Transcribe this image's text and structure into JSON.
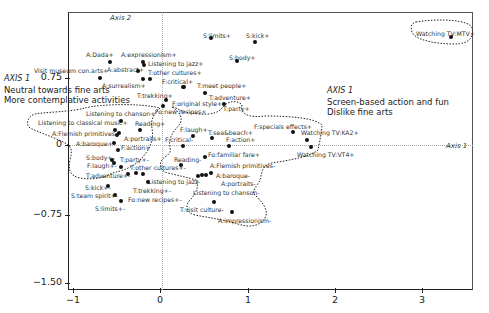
{
  "chart_data": {
    "type": "scatter",
    "title": "",
    "xlabel": "Axis 1",
    "ylabel": "Axis 2",
    "xlim": [
      -1.05,
      3.5
    ],
    "ylim": [
      -1.6,
      1.5
    ],
    "grid": false,
    "x_ticks": [
      "-1",
      "0",
      "1",
      "2",
      "3"
    ],
    "y_ticks": [
      "0.75",
      "0",
      "-0.75",
      "-1.50"
    ],
    "annotations": {
      "left": {
        "axis": "AXIS 1",
        "lines": [
          "Neutral towards fine arts",
          "More contemplative activities"
        ]
      },
      "right": {
        "axis": "AXIS 1",
        "lines": [
          "Screen-based action and fun",
          "Dislike fine arts"
        ]
      },
      "axis1_label": "Axis 1",
      "axis2_label": "Axis 2"
    },
    "points": [
      {
        "label": "Watching TV:MTV+",
        "x": 3.17,
        "y": 1.08
      },
      {
        "label": "S:limits+",
        "x": 0.55,
        "y": 1.18
      },
      {
        "label": "S:kick+",
        "x": 1.05,
        "y": 1.15
      },
      {
        "label": "S:body+",
        "x": 0.88,
        "y": 0.95
      },
      {
        "label": "A:Dada+",
        "x": -0.55,
        "y": 0.92
      },
      {
        "label": "A:expressionism+",
        "x": -0.1,
        "y": 0.92
      },
      {
        "label": "Listening to jazz+",
        "x": -0.08,
        "y": 0.88
      },
      {
        "label": "A:abstract+",
        "x": -0.17,
        "y": 0.82
      },
      {
        "label": "T:other cultures+",
        "x": -0.08,
        "y": 0.78
      },
      {
        "label": "Visit museum con.arts+",
        "x": -0.63,
        "y": 0.79
      },
      {
        "label": "A:surrealism+",
        "x": -0.08,
        "y": 0.74
      },
      {
        "label": "F:critical+",
        "x": 0.15,
        "y": 0.69
      },
      {
        "label": "T:meet people+",
        "x": 0.3,
        "y": 0.64
      },
      {
        "label": "T:adventure+",
        "x": 0.47,
        "y": 0.62
      },
      {
        "label": "T:trekking+",
        "x": 0.13,
        "y": 0.58
      },
      {
        "label": "F:original style+",
        "x": -0.02,
        "y": 0.53
      },
      {
        "label": "T:party+",
        "x": 0.5,
        "y": 0.55
      },
      {
        "label": "Fo:new recipes+",
        "x": -0.03,
        "y": 0.49
      },
      {
        "label": "Listening to chanson+",
        "x": -0.33,
        "y": 0.38
      },
      {
        "label": "Reading+",
        "x": -0.15,
        "y": 0.3
      },
      {
        "label": "Listening to classical music+",
        "x": -0.48,
        "y": 0.26
      },
      {
        "label": "A:Flemish primitives+",
        "x": -0.42,
        "y": 0.22
      },
      {
        "label": "A:portraits+",
        "x": -0.46,
        "y": 0.18
      },
      {
        "label": "A:baroque+",
        "x": -0.49,
        "y": 0.1
      },
      {
        "label": "F:action+",
        "x": -0.38,
        "y": 0.01
      },
      {
        "label": "F:specials effects+",
        "x": 1.5,
        "y": 0.18
      },
      {
        "label": "Watching TV:KA2+",
        "x": 1.65,
        "y": 0.12
      },
      {
        "label": "Watching TV:VT4+",
        "x": 1.72,
        "y": 0.05
      },
      {
        "label": "F:laugh+",
        "x": 0.18,
        "y": 0.14
      },
      {
        "label": "T:sea&beach+",
        "x": 0.38,
        "y": 0.1
      },
      {
        "label": "F:action+",
        "x": 0.57,
        "y": 0.09
      },
      {
        "label": "F:critical-",
        "x": 0.09,
        "y": 0.03
      },
      {
        "label": "Fo:familiar fare+",
        "x": 0.35,
        "y": -0.06
      },
      {
        "label": "Reading-",
        "x": 0.25,
        "y": -0.17
      },
      {
        "label": "A:Flemish primitives-",
        "x": 0.55,
        "y": -0.18
      },
      {
        "label": "A:baroque-",
        "x": 0.47,
        "y": -0.24
      },
      {
        "label": "A:portraits-",
        "x": 0.4,
        "y": -0.25
      },
      {
        "label": "Listening to chanson-",
        "x": 0.3,
        "y": -0.26
      },
      {
        "label": "T:visit culture-",
        "x": 0.58,
        "y": -0.55
      },
      {
        "label": "A:impressionism-",
        "x": 0.81,
        "y": -0.6
      },
      {
        "label": "S:body+-",
        "x": -0.53,
        "y": -0.08
      },
      {
        "label": "T:party+-",
        "x": -0.3,
        "y": -0.1
      },
      {
        "label": "F:laugh+-",
        "x": -0.52,
        "y": -0.12
      },
      {
        "label": "T:other cultures+-",
        "x": -0.4,
        "y": -0.18
      },
      {
        "label": "T:adventure+-",
        "x": -0.31,
        "y": -0.27
      },
      {
        "label": "Listening to jazz-",
        "x": -0.2,
        "y": -0.26
      },
      {
        "label": "T:trekking+-",
        "x": -0.08,
        "y": -0.35
      },
      {
        "label": "Fo:new recipes+-",
        "x": -0.15,
        "y": -0.3
      },
      {
        "label": "S:kick+-",
        "x": -0.58,
        "y": -0.42
      },
      {
        "label": "S:team spirit+-",
        "x": -0.5,
        "y": -0.53
      },
      {
        "label": "S:limits+-",
        "x": -0.44,
        "y": -0.6
      }
    ]
  },
  "axes": {
    "x_ticks": [
      {
        "label": "-1",
        "px": 73
      },
      {
        "label": "0",
        "px": 160
      },
      {
        "label": "1",
        "px": 248
      },
      {
        "label": "2",
        "px": 335
      },
      {
        "label": "3",
        "px": 422
      }
    ],
    "y_ticks": [
      {
        "label": "0.75",
        "py": 78
      },
      {
        "label": "0",
        "py": 145
      },
      {
        "label": "-0.75",
        "py": 215
      },
      {
        "label": "-1.50",
        "py": 283
      }
    ],
    "axis1_label": "Axis 1",
    "axis2_label": "Axis 2"
  },
  "annotations": {
    "left_axis": "AXIS 1",
    "left_line1": "Neutral towards fine arts",
    "left_line2": "More contemplative activities",
    "right_axis": "AXIS 1",
    "right_line1": "Screen-based action and fun",
    "right_line2": "Dislike fine arts"
  },
  "labels": [
    {
      "text": "Watching TV:MTV+",
      "px": 416,
      "py": 31,
      "dx": 451,
      "dy": 37
    },
    {
      "text": "S:limits+",
      "px": 203,
      "py": 33,
      "dx": 211,
      "dy": 38
    },
    {
      "text": "S:kick+",
      "px": 246,
      "py": 33,
      "dx": 255,
      "dy": 42
    },
    {
      "text": "S:body+",
      "px": 229,
      "py": 55,
      "dx": 237,
      "dy": 61
    },
    {
      "text": "A:Dada+",
      "px": 86,
      "py": 52,
      "dx": 110,
      "dy": 62
    },
    {
      "text": "A:expressionism+",
      "px": 121,
      "py": 52,
      "dx": 143,
      "dy": 62
    },
    {
      "text": "Listening to jazz+",
      "px": 148,
      "py": 61,
      "dx": 144,
      "dy": 65
    },
    {
      "text": "A:abstract+",
      "px": 107,
      "py": 67,
      "dx": 138,
      "dy": 71
    },
    {
      "text": "T:other cultures+",
      "px": 148,
      "py": 70
    },
    {
      "text": "Visit museum con.arts+",
      "px": 34,
      "py": 68,
      "dx": 100,
      "dy": 78
    },
    {
      "text": "A:surrealism+",
      "px": 102,
      "py": 83,
      "dx": 143,
      "dy": 79
    },
    {
      "text": "F:critical+",
      "px": 162,
      "py": 79,
      "dx": 150,
      "dy": 79
    },
    {
      "text": "T:meet people+",
      "px": 197,
      "py": 83,
      "dx": 183,
      "dy": 87
    },
    {
      "text": "T:trekking+",
      "px": 137,
      "py": 93,
      "dx": 184,
      "dy": 87
    },
    {
      "text": "T:adventure+",
      "px": 209,
      "py": 95,
      "dx": 205,
      "dy": 93
    },
    {
      "text": "F:original style+",
      "px": 172,
      "py": 101,
      "dx": 166,
      "dy": 100
    },
    {
      "text": "T:party+",
      "px": 223,
      "py": 106,
      "dx": 224,
      "dy": 104
    },
    {
      "text": "Fo:new recipes+",
      "px": 155,
      "py": 109,
      "dx": 163,
      "dy": 106
    },
    {
      "text": "Listening to chanson+",
      "px": 86,
      "py": 111,
      "dx": 121,
      "dy": 121
    },
    {
      "text": "Reading+",
      "px": 135,
      "py": 121,
      "dx": 140,
      "dy": 130
    },
    {
      "text": "Listening to classical music+",
      "px": 38,
      "py": 120,
      "dx": 115,
      "dy": 130
    },
    {
      "text": "A:Flemish primitives+",
      "px": 52,
      "py": 131,
      "dx": 119,
      "dy": 133
    },
    {
      "text": "A:portraits+",
      "px": 124,
      "py": 136,
      "dx": 117,
      "dy": 135
    },
    {
      "text": "A:baroque+",
      "px": 76,
      "py": 141,
      "dx": 114,
      "dy": 143
    },
    {
      "text": "F:action+",
      "px": 121,
      "py": 145,
      "dx": 118,
      "dy": 150
    },
    {
      "text": "F:specials effects+",
      "px": 254,
      "py": 124,
      "dx": 293,
      "dy": 132
    },
    {
      "text": "Watching TV:KA2+",
      "px": 301,
      "py": 130,
      "dx": 307,
      "dy": 140
    },
    {
      "text": "Watching TV:VT4+",
      "px": 297,
      "py": 152,
      "dx": 311,
      "dy": 147
    },
    {
      "text": "F:laugh+",
      "px": 180,
      "py": 127,
      "dx": 193,
      "dy": 136
    },
    {
      "text": "T:sea&beach+",
      "px": 208,
      "py": 130,
      "dx": 212,
      "dy": 138
    },
    {
      "text": "F:action+",
      "px": 226,
      "py": 137,
      "dx": 229,
      "dy": 146
    },
    {
      "text": "F:critical-",
      "px": 165,
      "py": 137,
      "dx": 183,
      "dy": 146
    },
    {
      "text": "Fo:familiar fare+",
      "px": 208,
      "py": 152,
      "dx": 205,
      "dy": 157
    },
    {
      "text": "Reading-",
      "px": 174,
      "py": 157,
      "dx": 181,
      "dy": 165
    },
    {
      "text": "A:Flemish primitives-",
      "px": 210,
      "py": 163,
      "dx": 211,
      "dy": 173
    },
    {
      "text": "A:baroque-",
      "px": 216,
      "py": 173,
      "dx": 206,
      "dy": 175
    },
    {
      "text": "A:portraits-",
      "px": 221,
      "py": 181,
      "dx": 202,
      "dy": 175
    },
    {
      "text": "Listening to chanson-",
      "px": 193,
      "py": 190,
      "dx": 198,
      "dy": 176
    },
    {
      "text": "T:visit culture-",
      "px": 180,
      "py": 207,
      "dx": 214,
      "dy": 202
    },
    {
      "text": "A:impressionism-",
      "px": 218,
      "py": 218,
      "dx": 232,
      "dy": 212
    },
    {
      "text": "S:body+-",
      "px": 86,
      "py": 155,
      "dx": 112,
      "dy": 160
    },
    {
      "text": "T:party+-",
      "px": 120,
      "py": 157,
      "dx": 121,
      "dy": 167
    },
    {
      "text": "F:laugh+-",
      "px": 87,
      "py": 163,
      "dx": 114,
      "dy": 163
    },
    {
      "text": "T:other cultures+-",
      "px": 130,
      "py": 165,
      "dx": 136,
      "dy": 173
    },
    {
      "text": "T:adventure+-",
      "px": 86,
      "py": 173,
      "dx": 128,
      "dy": 174
    },
    {
      "text": "Listening to jazz-",
      "px": 148,
      "py": 179,
      "dx": 143,
      "dy": 174
    },
    {
      "text": "T:trekking+-",
      "px": 133,
      "py": 188,
      "dx": 148,
      "dy": 182
    },
    {
      "text": "Fo:new recipes+-",
      "px": 128,
      "py": 197
    },
    {
      "text": "S:kick+-",
      "px": 85,
      "py": 185,
      "dx": 108,
      "dy": 186
    },
    {
      "text": "S:team spirit+-",
      "px": 71,
      "py": 193,
      "dx": 115,
      "dy": 195
    },
    {
      "text": "S:limits+-",
      "px": 95,
      "py": 206,
      "dx": 121,
      "dy": 201
    }
  ]
}
